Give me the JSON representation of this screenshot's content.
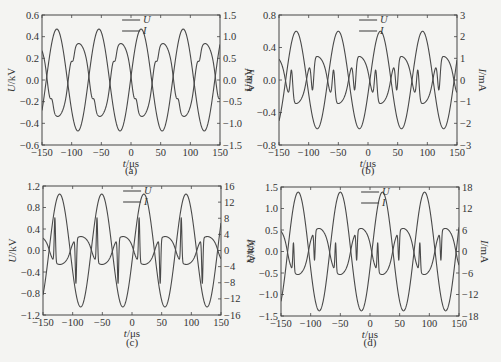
{
  "chart_data": [
    {
      "id": "a",
      "type": "line",
      "caption": "(a)",
      "xlabel_italic": "t",
      "xlabel_unit": "/μs",
      "ylabel_italic": "U",
      "ylabel_unit": "/kV",
      "y2label_italic": "I",
      "y2label_unit": "/mA",
      "xlim": [
        -150,
        150
      ],
      "ylim": [
        -0.6,
        0.6
      ],
      "y2lim": [
        -1.5,
        1.5
      ],
      "xticks": [
        -150,
        -100,
        -50,
        0,
        50,
        100,
        150
      ],
      "yticks": [
        "-0.6",
        "-0.4",
        "-0.2",
        "0.0",
        "0.2",
        "0.4",
        "0.6"
      ],
      "yticks_val": [
        -0.6,
        -0.4,
        -0.2,
        0.0,
        0.2,
        0.4,
        0.6
      ],
      "y2ticks": [
        "-1.5",
        "-1.0",
        "-0.5",
        "0.0",
        "0.5",
        "1.0",
        "1.5"
      ],
      "y2ticks_val": [
        -1.5,
        -1.0,
        -0.5,
        0.0,
        0.5,
        1.0,
        1.5
      ],
      "legend": [
        "U",
        "I"
      ],
      "legend_position": "top-center",
      "period_us": 71,
      "series": [
        {
          "name": "U",
          "axis": "left",
          "amplitude": 0.47,
          "first_peak_us": -125
        },
        {
          "name": "I",
          "axis": "right",
          "plateau": 0.85,
          "spike": 0.2,
          "spike_width_us": 3,
          "lead_us": 34
        }
      ]
    },
    {
      "id": "b",
      "type": "line",
      "caption": "(b)",
      "xlabel_italic": "t",
      "xlabel_unit": "/μs",
      "ylabel_italic": "U",
      "ylabel_unit": "/kV",
      "y2label_italic": "I",
      "y2label_unit": "/mA",
      "xlim": [
        -150,
        150
      ],
      "ylim": [
        -0.8,
        0.8
      ],
      "y2lim": [
        -3,
        3
      ],
      "xticks": [
        -150,
        -100,
        -50,
        0,
        50,
        100,
        150
      ],
      "yticks": [
        "-0.8",
        "-0.4",
        "0.0",
        "0.4",
        "0.8"
      ],
      "yticks_val": [
        -0.8,
        -0.4,
        0.0,
        0.4,
        0.8
      ],
      "y2ticks": [
        "-3",
        "-2",
        "-1",
        "0",
        "1",
        "2",
        "3"
      ],
      "y2ticks_val": [
        -3,
        -2,
        -1,
        0,
        1,
        2,
        3
      ],
      "legend": [
        "U",
        "I"
      ],
      "legend_position": "top-center",
      "period_us": 71,
      "series": [
        {
          "name": "U",
          "axis": "left",
          "amplitude": 0.6,
          "first_peak_us": -121
        },
        {
          "name": "I",
          "axis": "right",
          "plateau": 1.1,
          "spike": 1.4,
          "spike_width_us": 3,
          "lead_us": 36
        }
      ]
    },
    {
      "id": "c",
      "type": "line",
      "caption": "(c)",
      "xlabel_italic": "t",
      "xlabel_unit": "/μs",
      "ylabel_italic": "U",
      "ylabel_unit": "/kV",
      "y2label_italic": "I",
      "y2label_unit": "/mA",
      "xlim": [
        -150,
        150
      ],
      "ylim": [
        -1.2,
        1.2
      ],
      "y2lim": [
        -16,
        16
      ],
      "xticks": [
        -150,
        -100,
        -50,
        0,
        50,
        100,
        150
      ],
      "yticks": [
        "-1.2",
        "-0.8",
        "-0.4",
        "0.0",
        "0.4",
        "0.8",
        "1.2"
      ],
      "yticks_val": [
        -1.2,
        -0.8,
        -0.4,
        0.0,
        0.4,
        0.8,
        1.2
      ],
      "y2ticks": [
        "-16",
        "-12",
        "-8",
        "-4",
        "0",
        "4",
        "8",
        "12",
        "16"
      ],
      "y2ticks_val": [
        -16,
        -12,
        -8,
        -4,
        0,
        4,
        8,
        12,
        16
      ],
      "legend": [
        "U",
        "I"
      ],
      "legend_position": "top-center",
      "period_us": 71,
      "series": [
        {
          "name": "U",
          "axis": "left",
          "amplitude": 1.05,
          "first_peak_us": -122
        },
        {
          "name": "I",
          "axis": "right",
          "plateau": 3.5,
          "spike": 11,
          "spike_width_us": 1.5,
          "lead_us": 35
        }
      ]
    },
    {
      "id": "d",
      "type": "line",
      "caption": "(d)",
      "xlabel_italic": "t",
      "xlabel_unit": "/μs",
      "ylabel_italic": "U",
      "ylabel_unit": "/kV",
      "y2label_italic": "I",
      "y2label_unit": "/mA",
      "xlim": [
        -150,
        150
      ],
      "ylim": [
        -1.5,
        1.5
      ],
      "y2lim": [
        -18,
        18
      ],
      "xticks": [
        -150,
        -100,
        -50,
        0,
        50,
        100,
        150
      ],
      "yticks": [
        "-1.5",
        "-1.0",
        "-0.5",
        "0.0",
        "0.5",
        "1.0",
        "1.5"
      ],
      "yticks_val": [
        -1.5,
        -1.0,
        -0.5,
        0.0,
        0.5,
        1.0,
        1.5
      ],
      "y2ticks": [
        "-18",
        "-12",
        "-6",
        "0",
        "6",
        "12",
        "18"
      ],
      "y2ticks_val": [
        -18,
        -12,
        -6,
        0,
        6,
        12,
        18
      ],
      "legend": [
        "U",
        "I"
      ],
      "legend_position": "top-center",
      "period_us": 71,
      "series": [
        {
          "name": "U",
          "axis": "left",
          "amplitude": 1.38,
          "first_peak_us": -121
        },
        {
          "name": "I",
          "axis": "right",
          "plateau": 6.5,
          "spike": 8,
          "spike_width_us": 1.5,
          "lead_us": 36
        }
      ]
    }
  ]
}
